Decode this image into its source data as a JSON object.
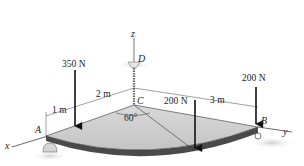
{
  "figure": {
    "type": "statics-3d-plate",
    "axes": {
      "x": "x",
      "y": "y",
      "z": "z"
    },
    "points": {
      "A": "A",
      "B": "B",
      "C": "C",
      "D": "D"
    },
    "forces": [
      {
        "id": "f1",
        "label": "350 N"
      },
      {
        "id": "f2",
        "label": "200 N"
      },
      {
        "id": "f3",
        "label": "200 N"
      }
    ],
    "dimensions": {
      "d1": "1 m",
      "d2": "2 m",
      "d3": "3 m"
    },
    "angle": "60°",
    "colors": {
      "plate_top": "#cfcfcf",
      "plate_edge": "#4a4a4a",
      "line": "#222222",
      "shadow": "#d9d9d9"
    }
  }
}
